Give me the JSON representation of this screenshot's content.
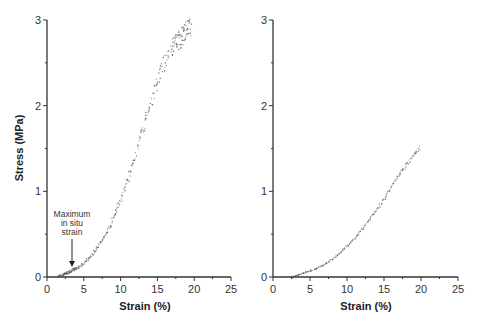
{
  "chart_data": [
    {
      "type": "scatter",
      "title": "",
      "xlabel": "Strain (%)",
      "ylabel": "Stress (MPa)",
      "xlim": [
        0,
        25
      ],
      "ylim": [
        0,
        3
      ],
      "xticks": [
        0,
        5,
        10,
        15,
        20,
        25
      ],
      "yticks": [
        0,
        1,
        2,
        3
      ],
      "grid": false,
      "annotations": [
        {
          "text": "Maximum in situ strain",
          "lines": [
            "Maximum",
            "in situ",
            "strain"
          ],
          "arrow_to": {
            "x": 3.5,
            "y": 0.12
          }
        }
      ],
      "series": [
        {
          "name": "left",
          "x": [
            1.5,
            2,
            2.5,
            3,
            3.5,
            4,
            5,
            6,
            7,
            8,
            9,
            10,
            11,
            12,
            13,
            14,
            15,
            16,
            17,
            17.5,
            18,
            18.5,
            19,
            19.5
          ],
          "y": [
            0.01,
            0.03,
            0.05,
            0.07,
            0.09,
            0.11,
            0.17,
            0.26,
            0.38,
            0.52,
            0.7,
            0.92,
            1.18,
            1.45,
            1.75,
            2.05,
            2.32,
            2.55,
            2.7,
            2.74,
            2.78,
            2.85,
            2.9,
            2.94
          ]
        }
      ]
    },
    {
      "type": "scatter",
      "title": "",
      "xlabel": "Strain (%)",
      "ylabel": "",
      "xlim": [
        0,
        25
      ],
      "ylim": [
        0,
        3
      ],
      "xticks": [
        0,
        5,
        10,
        15,
        20,
        25
      ],
      "yticks": [
        0,
        1,
        2,
        3
      ],
      "grid": false,
      "series": [
        {
          "name": "right",
          "x": [
            2.5,
            3,
            4,
            5,
            6,
            7,
            8,
            9,
            10,
            11,
            12,
            13,
            14,
            15,
            16,
            17,
            18,
            19,
            19.8
          ],
          "y": [
            0.0,
            0.02,
            0.05,
            0.08,
            0.11,
            0.16,
            0.22,
            0.29,
            0.37,
            0.46,
            0.57,
            0.68,
            0.8,
            0.93,
            1.07,
            1.2,
            1.32,
            1.44,
            1.52
          ]
        }
      ]
    }
  ],
  "plots": {
    "left": {
      "ylabel": "Stress (MPa)",
      "xlabel": "Strain (%)",
      "xtick_labels": [
        "0",
        "5",
        "10",
        "15",
        "20",
        "25"
      ],
      "ytick_labels": [
        "0",
        "1",
        "2",
        "3"
      ],
      "annotation": [
        "Maximum",
        "in situ",
        "strain"
      ]
    },
    "right": {
      "xlabel": "Strain (%)",
      "xtick_labels": [
        "0",
        "5",
        "10",
        "15",
        "20",
        "25"
      ],
      "ytick_labels": [
        "0",
        "1",
        "2",
        "3"
      ]
    }
  },
  "colors": {
    "axis": "#333333",
    "points": "#555555",
    "background": "#ffffff"
  }
}
